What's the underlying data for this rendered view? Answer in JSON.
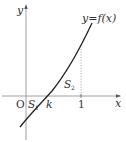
{
  "diagram": {
    "function_label": "y=f(x)",
    "axes": {
      "x_label": "x",
      "y_label": "y",
      "origin_label": "O"
    },
    "points": {
      "k_label": "k",
      "one_label": "1"
    },
    "regions": {
      "s1_label": "S",
      "s1_sub": "1",
      "s2_label": "S",
      "s2_sub": "2"
    },
    "colors": {
      "axis": "#777777",
      "curve": "#222222",
      "dotted": "#999999",
      "text": "#333333"
    }
  }
}
